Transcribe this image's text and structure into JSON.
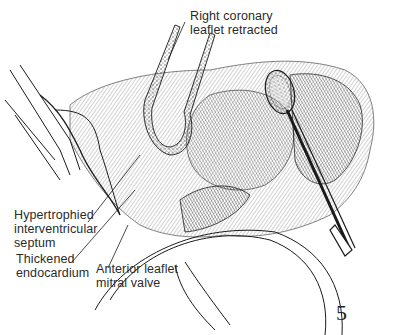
{
  "figure": {
    "number": "5",
    "type": "surgical anatomical illustration (line drawing)",
    "top_caption_visible": false
  },
  "labels": [
    {
      "id": "right-coronary-leaflet",
      "lines": [
        "Right coronary",
        "leaflet retracted"
      ]
    },
    {
      "id": "hypertrophied-septum",
      "lines": [
        "Hypertrophied",
        "interventricular",
        "septum"
      ]
    },
    {
      "id": "thickened-endocardium",
      "lines": [
        "Thickened",
        "endocardium"
      ]
    },
    {
      "id": "anterior-mitral-leaflet",
      "lines": [
        "Anterior leaflet",
        "mitral valve"
      ]
    }
  ],
  "colors": {
    "ink": "#1a1a1a",
    "background": "#ffffff"
  }
}
